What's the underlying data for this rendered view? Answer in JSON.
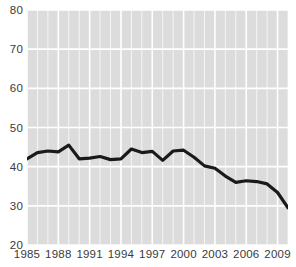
{
  "chart_data": {
    "type": "line",
    "title": "",
    "subtitle": "",
    "xlabel": "",
    "ylabel": "",
    "xlim": [
      1985,
      2010
    ],
    "ylim": [
      20,
      80
    ],
    "y_ticks": [
      20,
      30,
      40,
      50,
      60,
      70,
      80
    ],
    "y_tick_labels": [
      "20",
      "30",
      "40",
      "50",
      "60",
      "70",
      "80"
    ],
    "x_ticks": [
      1985,
      1988,
      1991,
      1994,
      1997,
      2000,
      2003,
      2006,
      2009
    ],
    "x_tick_labels": [
      "1985",
      "1988",
      "1991",
      "1994",
      "1997",
      "2000",
      "2003",
      "2006",
      "2009"
    ],
    "grid": {
      "horizontal": true,
      "vertical": true,
      "color": "#ffffff",
      "minor_vertical": true
    },
    "legend": {
      "visible": false,
      "position": "none",
      "entries": []
    },
    "annotations": [],
    "plot_background": "#dcdcdc",
    "figure_background": "#ffffff",
    "series": [
      {
        "name": "series-1",
        "color": "#1a1a1a",
        "line_width": 3.2,
        "x": [
          1985,
          1986,
          1987,
          1988,
          1989,
          1990,
          1991,
          1992,
          1993,
          1994,
          1995,
          1996,
          1997,
          1998,
          1999,
          2000,
          2001,
          2002,
          2003,
          2004,
          2005,
          2006,
          2007,
          2008,
          2009,
          2010
        ],
        "values": [
          42.0,
          43.6,
          44.0,
          43.8,
          45.5,
          42.0,
          42.2,
          42.6,
          41.8,
          42.0,
          44.5,
          43.6,
          43.9,
          41.6,
          44.0,
          44.2,
          42.4,
          40.2,
          39.6,
          37.6,
          36.0,
          36.4,
          36.2,
          35.6,
          33.4,
          29.5
        ]
      }
    ]
  }
}
